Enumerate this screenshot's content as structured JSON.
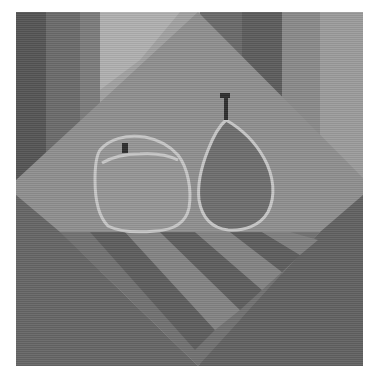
{
  "artwork": {
    "subject": "Geometric still life: apple and pear on a table",
    "description": "Grayscale cubist-style composition with vertical background bands, a tilted diamond backdrop, an apple and a pear outlined in light gray, and diagonal stripes on the table.",
    "colors": {
      "page_background": "#ffffff",
      "band_far_left": "#555555",
      "band_left": "#6b6b6b",
      "band_left_mid": "#7c7c7c",
      "band_center_light": "#a2a2a2",
      "band_right_dark": "#5c5c5c",
      "band_right_mid": "#8a8a8a",
      "band_far_right": "#9c9c9c",
      "diamond_upper": "#8f8f8f",
      "table_dark": "#666666",
      "table_mid": "#727272",
      "stripe_light": "#808080",
      "stripe_dark": "#5e5e5e",
      "apple_fill": "#969696",
      "pear_fill": "#6f6f6f",
      "fruit_outline": "#c8c8c8",
      "stem": "#2e2e2e"
    },
    "objects": [
      {
        "name": "apple",
        "label": "Apple"
      },
      {
        "name": "pear",
        "label": "Pear"
      }
    ]
  }
}
